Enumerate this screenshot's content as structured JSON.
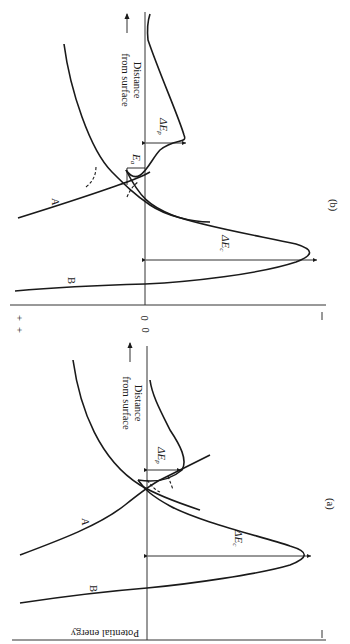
{
  "figure": {
    "orientation": "rotated 90 degrees clockwise",
    "axis_labels": {
      "y_axis": "Potential energy",
      "x_axis": "Distance from surface"
    },
    "energy_ticks": {
      "plus": "+",
      "zero": "0",
      "minus": "—"
    },
    "panels": [
      {
        "id": "b",
        "label": "(b)",
        "curves": [
          {
            "name": "A",
            "label": "A"
          },
          {
            "name": "B",
            "label": "B"
          }
        ],
        "annotations": {
          "chemisorption_depth": "ΔE",
          "chemisorption_sub": "c",
          "physisorption_depth": "ΔE",
          "physisorption_sub": "p",
          "activation_energy": "E",
          "activation_sub": "a"
        },
        "distance_label_line1": "Distance",
        "distance_label_line2": "from surface"
      },
      {
        "id": "a",
        "label": "(a)",
        "curves": [
          {
            "name": "A",
            "label": "A"
          },
          {
            "name": "B",
            "label": "B"
          }
        ],
        "annotations": {
          "chemisorption_depth": "ΔE",
          "chemisorption_sub": "c",
          "physisorption_depth": "ΔE",
          "physisorption_sub": "p"
        },
        "distance_label_line1": "Distance",
        "distance_label_line2": "from surface"
      }
    ]
  }
}
